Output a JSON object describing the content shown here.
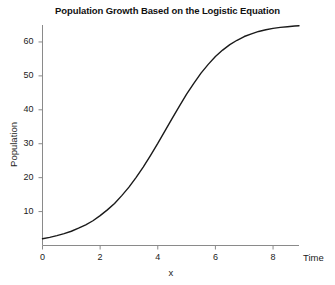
{
  "chart_data": {
    "type": "line",
    "title": "Population Growth Based on the Logistic Equation",
    "xlabel": "x",
    "xlabel_axis_end": "Time",
    "ylabel": "Population",
    "xlim": [
      0,
      8.9
    ],
    "ylim": [
      0,
      65
    ],
    "xticks": [
      0,
      2,
      4,
      6,
      8
    ],
    "xticklabels": [
      "0",
      "2",
      "4",
      "6",
      "8"
    ],
    "yticks": [
      10,
      20,
      30,
      40,
      50,
      60
    ],
    "yticklabels": [
      "10",
      "20",
      "30",
      "40",
      "50",
      "60"
    ],
    "grid": false,
    "legend": null,
    "line_color": "#1a1a1a",
    "axis_color": "#8a8a8a",
    "series": [
      {
        "name": "Population",
        "x": [
          0,
          0.25,
          0.5,
          0.75,
          1,
          1.25,
          1.5,
          1.75,
          2,
          2.25,
          2.5,
          2.75,
          3,
          3.25,
          3.5,
          3.75,
          4,
          4.25,
          4.5,
          4.75,
          5,
          5.25,
          5.5,
          5.75,
          6,
          6.25,
          6.5,
          6.75,
          7,
          7.25,
          7.5,
          7.75,
          8,
          8.25,
          8.5,
          8.75,
          8.9
        ],
        "y": [
          2.0,
          2.4,
          2.9,
          3.5,
          4.2,
          5.1,
          6.1,
          7.3,
          8.8,
          10.5,
          12.4,
          14.7,
          17.2,
          20.1,
          23.2,
          26.6,
          30.1,
          33.8,
          37.5,
          41.1,
          44.6,
          47.8,
          50.8,
          53.4,
          55.7,
          57.6,
          59.2,
          60.5,
          61.6,
          62.4,
          63.1,
          63.6,
          64.0,
          64.3,
          64.5,
          64.7,
          64.8
        ]
      }
    ],
    "equation_params": {
      "carrying_capacity": 65,
      "initial_population": 2,
      "growth_rate": 0.82
    }
  }
}
